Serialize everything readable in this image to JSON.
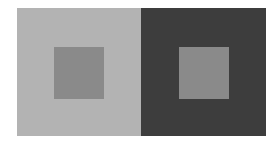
{
  "figure": {
    "panels": [
      {
        "name": "light-background",
        "background_color": "#b3b3b3",
        "square_color": "#8a8a8a"
      },
      {
        "name": "dark-background",
        "background_color": "#3d3d3d",
        "square_color": "#8a8a8a"
      }
    ]
  }
}
